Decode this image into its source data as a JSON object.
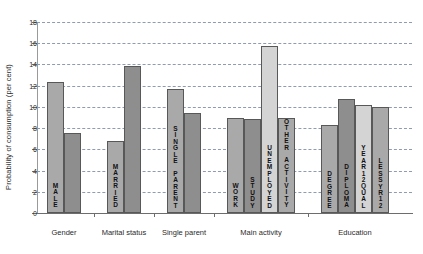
{
  "chart_data": {
    "type": "bar",
    "title": "",
    "xlabel": "",
    "ylabel": "Probability of consumption (per cent)",
    "ylim": [
      0,
      18
    ],
    "ytick_step": 2,
    "yticks": [
      "0",
      "2",
      "4",
      "6",
      "8",
      "10",
      "12",
      "14",
      "16",
      "18"
    ],
    "grid": true,
    "legend": "none",
    "groups": [
      {
        "name": "Gender",
        "bars": [
          {
            "label": "MALE",
            "value": 12.3,
            "color": "#a9a9a9",
            "label_shown": true
          },
          {
            "label": "",
            "value": 7.5,
            "color": "#8e8e8e",
            "label_shown": false
          }
        ]
      },
      {
        "name": "Marital status",
        "bars": [
          {
            "label": "MARRIED",
            "value": 6.8,
            "color": "#a9a9a9",
            "label_shown": true
          },
          {
            "label": "",
            "value": 13.9,
            "color": "#8e8e8e",
            "label_shown": false
          }
        ]
      },
      {
        "name": "Single parent",
        "bars": [
          {
            "label": "SINGLE PARENT",
            "value": 11.7,
            "color": "#a9a9a9",
            "label_shown": true
          },
          {
            "label": "",
            "value": 9.4,
            "color": "#8e8e8e",
            "label_shown": false
          }
        ]
      },
      {
        "name": "Main activity",
        "bars": [
          {
            "label": "WORK",
            "value": 9.0,
            "color": "#a9a9a9",
            "label_shown": true
          },
          {
            "label": "STUDY",
            "value": 8.9,
            "color": "#8e8e8e",
            "label_shown": true
          },
          {
            "label": "UNEMPLOYED",
            "value": 15.7,
            "color": "#d4d4d4",
            "label_shown": true
          },
          {
            "label": "OTHER ACTIVITY",
            "value": 9.0,
            "color": "#a9a9a9",
            "label_shown": true
          }
        ]
      },
      {
        "name": "Education",
        "bars": [
          {
            "label": "DEGREE",
            "value": 8.3,
            "color": "#a9a9a9",
            "label_shown": true
          },
          {
            "label": "DIPLOMA",
            "value": 10.7,
            "color": "#8e8e8e",
            "label_shown": true
          },
          {
            "label": "YEAR12QUAL",
            "value": 10.2,
            "color": "#d4d4d4",
            "label_shown": true
          },
          {
            "label": "LESSYR12",
            "value": 10.0,
            "color": "#a9a9a9",
            "label_shown": true
          }
        ]
      }
    ]
  },
  "colors": {
    "grid": "#8f9bb3",
    "axis": "#6d6d6d",
    "bar_border": "#585858",
    "text": "#2b2b2b",
    "background": "#ffffff"
  }
}
